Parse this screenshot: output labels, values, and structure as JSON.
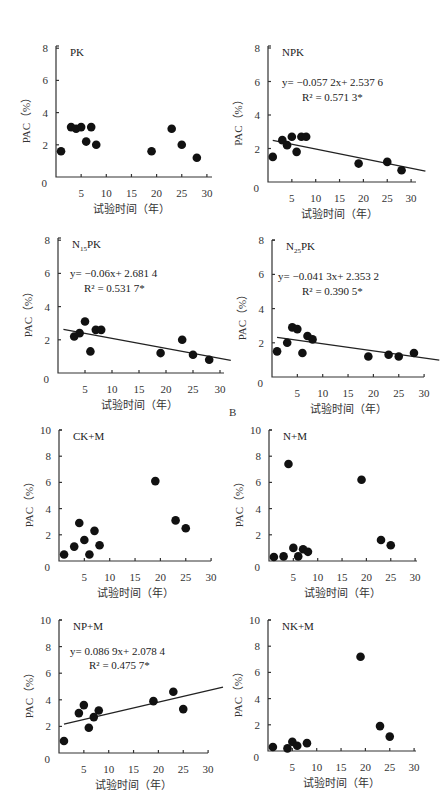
{
  "figure": {
    "section_label": "B",
    "x_axis_label": "试验时间（年）",
    "y_axis_label": "PAC（%）"
  },
  "chart_data": [
    {
      "type": "scatter",
      "title": "PK",
      "xlabel": "试验时间（年）",
      "ylabel": "PAC（%）",
      "xlim": [
        0,
        30
      ],
      "ylim": [
        0,
        8
      ],
      "x_ticks": [
        5,
        10,
        15,
        20,
        25,
        30
      ],
      "y_ticks": [
        0,
        2,
        4,
        6,
        8
      ],
      "x": [
        1,
        3,
        4,
        5,
        6,
        7,
        8,
        19,
        23,
        25,
        28
      ],
      "y": [
        1.6,
        3.1,
        3.0,
        3.1,
        2.2,
        3.1,
        2.0,
        1.6,
        3.0,
        2.0,
        1.2
      ],
      "trendline": null,
      "equation": "",
      "r2": "",
      "layout": {
        "ox": 56,
        "oy": 177,
        "xscale": 5.03,
        "yscale": 16.1,
        "xend": 212,
        "ytop": 46
      }
    },
    {
      "type": "scatter",
      "title": "NPK",
      "xlabel": "试验时间（年）",
      "ylabel": "PAC（%）",
      "xlim": [
        0,
        30
      ],
      "ylim": [
        0,
        8
      ],
      "x_ticks": [
        5,
        10,
        15,
        20,
        25,
        30
      ],
      "y_ticks": [
        0,
        2,
        4,
        6,
        8
      ],
      "x": [
        1,
        3,
        4,
        5,
        6,
        7,
        8,
        19,
        25,
        28
      ],
      "y": [
        1.5,
        2.5,
        2.2,
        2.7,
        1.8,
        2.7,
        2.7,
        1.1,
        1.2,
        0.7
      ],
      "trendline": {
        "slope": -0.0572,
        "intercept": 2.5376,
        "x_start": 1,
        "x_end": 33
      },
      "equation": "y= −0.057 2x+ 2.537 6",
      "r2": "R² = 0.571 3*",
      "layout": {
        "ox": 268,
        "oy": 182,
        "xscale": 4.77,
        "yscale": 16.75,
        "xend": 416,
        "ytop": 46,
        "eq_x": 282,
        "eq_y": 86,
        "r2_x": 302,
        "r2_y": 101
      }
    },
    {
      "type": "scatter",
      "title": "N15PK",
      "title_main": "N",
      "title_sub": "15",
      "title_rest": "PK",
      "xlabel": "试验时间（年）",
      "ylabel": "PAC（%）",
      "xlim": [
        0,
        30
      ],
      "ylim": [
        0,
        8
      ],
      "x_ticks": [
        5,
        10,
        15,
        20,
        25,
        30
      ],
      "y_ticks": [
        0,
        2,
        4,
        6,
        8
      ],
      "x": [
        3,
        4,
        5,
        6,
        7,
        8,
        19,
        23,
        25,
        28
      ],
      "y": [
        2.2,
        2.4,
        3.1,
        1.3,
        2.6,
        2.6,
        1.2,
        2.0,
        1.1,
        0.8
      ],
      "trendline": {
        "slope": -0.06,
        "intercept": 2.6814,
        "x_start": 1,
        "x_end": 32
      },
      "equation": "y= −0.06x+ 2.681 4",
      "r2": "R² = 0.531 7*",
      "layout": {
        "ox": 58,
        "oy": 373,
        "xscale": 5.4,
        "yscale": 16.6,
        "xend": 224,
        "ytop": 238,
        "eq_x": 70,
        "eq_y": 277,
        "r2_x": 84,
        "r2_y": 292
      }
    },
    {
      "type": "scatter",
      "title": "N25PK",
      "title_main": "N",
      "title_sub": "25",
      "title_rest": "PK",
      "xlabel": "试验时间（年）",
      "ylabel": "PAC（%）",
      "xlim": [
        0,
        30
      ],
      "ylim": [
        0,
        8
      ],
      "x_ticks": [
        5,
        10,
        15,
        20,
        25,
        30
      ],
      "y_ticks": [
        0,
        2,
        4,
        6,
        8
      ],
      "x": [
        1,
        3,
        4,
        5,
        6,
        7,
        8,
        19,
        23,
        25,
        28
      ],
      "y": [
        1.5,
        2.0,
        2.9,
        2.8,
        1.4,
        2.4,
        2.2,
        1.2,
        1.3,
        1.2,
        1.4
      ],
      "trendline": {
        "slope": -0.0413,
        "intercept": 2.3532,
        "x_start": 1,
        "x_end": 33
      },
      "equation": "y= −0.041 3x+ 2.353 2",
      "r2": "R² = 0.390 5*",
      "layout": {
        "ox": 272,
        "oy": 377,
        "xscale": 5.07,
        "yscale": 17.1,
        "xend": 424,
        "ytop": 240,
        "eq_x": 278,
        "eq_y": 280,
        "r2_x": 302,
        "r2_y": 295
      }
    },
    {
      "type": "scatter",
      "title": "CK+M",
      "xlabel": "试验时间（年）",
      "ylabel": "PAC（%）",
      "xlim": [
        0,
        30
      ],
      "ylim": [
        0,
        10
      ],
      "x_ticks": [
        5,
        10,
        15,
        20,
        25,
        30
      ],
      "y_ticks": [
        0,
        2,
        4,
        6,
        8,
        10
      ],
      "x": [
        1,
        3,
        4,
        5,
        6,
        7,
        8,
        19,
        23,
        25
      ],
      "y": [
        0.5,
        1.1,
        2.9,
        1.6,
        0.5,
        2.3,
        1.2,
        6.1,
        3.1,
        2.5
      ],
      "trendline": null,
      "equation": "",
      "r2": "",
      "layout": {
        "ox": 59,
        "oy": 561,
        "xscale": 5.07,
        "yscale": 13.1,
        "xend": 211,
        "ytop": 430
      }
    },
    {
      "type": "scatter",
      "title": "N+M",
      "xlabel": "试验时间（年）",
      "ylabel": "PAC（%）",
      "xlim": [
        0,
        30
      ],
      "ylim": [
        0,
        10
      ],
      "x_ticks": [
        5,
        10,
        15,
        20,
        25,
        30
      ],
      "y_ticks": [
        0,
        2,
        4,
        6,
        8,
        10
      ],
      "x": [
        1,
        3,
        4,
        5,
        6,
        7,
        8,
        19,
        23,
        25
      ],
      "y": [
        0.3,
        0.35,
        7.4,
        1.0,
        0.35,
        0.9,
        0.7,
        6.2,
        1.6,
        1.2
      ],
      "trendline": null,
      "equation": "",
      "r2": "",
      "layout": {
        "ox": 269,
        "oy": 561,
        "xscale": 4.87,
        "yscale": 13.1,
        "xend": 417,
        "ytop": 430
      }
    },
    {
      "type": "scatter",
      "title": "NP+M",
      "xlabel": "试验时间（年）",
      "ylabel": "PAC（%）",
      "xlim": [
        0,
        30
      ],
      "ylim": [
        0,
        10
      ],
      "x_ticks": [
        5,
        10,
        15,
        20,
        25,
        30
      ],
      "y_ticks": [
        0,
        2,
        4,
        6,
        8,
        10
      ],
      "x": [
        1,
        4,
        5,
        6,
        7,
        8,
        19,
        23,
        25
      ],
      "y": [
        0.9,
        3.0,
        3.6,
        1.9,
        2.7,
        3.2,
        3.9,
        4.6,
        3.3
      ],
      "trendline": {
        "slope": 0.0869,
        "intercept": 2.0784,
        "x_start": 1,
        "x_end": 33
      },
      "equation": "y= 0.086 9x+ 2.078 4",
      "r2": "R² = 0.475 7*",
      "layout": {
        "ox": 59,
        "oy": 753,
        "xscale": 4.97,
        "yscale": 13.3,
        "xend": 208,
        "ytop": 620,
        "eq_x": 70,
        "eq_y": 655,
        "r2_x": 89,
        "r2_y": 669
      }
    },
    {
      "type": "scatter",
      "title": "NK+M",
      "xlabel": "试验时间（年）",
      "ylabel": "PAC（%）",
      "xlim": [
        0,
        30
      ],
      "ylim": [
        0,
        10
      ],
      "x_ticks": [
        5,
        10,
        15,
        20,
        25,
        30
      ],
      "y_ticks": [
        0,
        2,
        4,
        6,
        8,
        10
      ],
      "x": [
        1,
        4,
        5,
        6,
        8,
        19,
        23,
        25
      ],
      "y": [
        0.3,
        0.2,
        0.7,
        0.4,
        0.6,
        7.2,
        1.9,
        1.1
      ],
      "trendline": null,
      "equation": "",
      "r2": "",
      "layout": {
        "ox": 268,
        "oy": 751,
        "xscale": 4.87,
        "yscale": 13.1,
        "xend": 416,
        "ytop": 620
      }
    }
  ]
}
